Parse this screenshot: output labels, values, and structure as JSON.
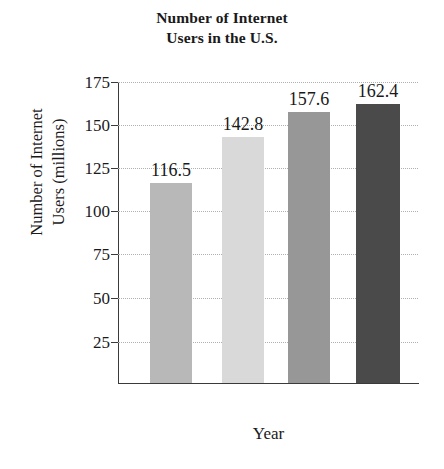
{
  "chart_data": {
    "type": "bar",
    "title": "Number of Internet Users in the U.S.",
    "title_lines": [
      "Number of Internet",
      "Users in the U.S."
    ],
    "xlabel": "Year",
    "ylabel": "Number of Internet Users (millions)",
    "ylabel_lines": [
      "Number of Internet",
      "Users (millions)"
    ],
    "categories": [
      "2000",
      "2001",
      "2002",
      "2003"
    ],
    "values": [
      116.5,
      142.8,
      157.6,
      162.4
    ],
    "value_labels": [
      "116.5",
      "142.8",
      "157.6",
      "162.4"
    ],
    "bar_colors": [
      "#b8b8b8",
      "#d9d9d9",
      "#979797",
      "#4a4a4a"
    ],
    "ylim": [
      0,
      175
    ],
    "yticks": [
      25,
      50,
      75,
      100,
      125,
      150,
      175
    ],
    "ytick_labels": [
      "25",
      "50",
      "75",
      "100",
      "125",
      "150",
      "175"
    ],
    "grid": true,
    "grid_style": "dotted",
    "legend": false,
    "legend_position": "none"
  }
}
